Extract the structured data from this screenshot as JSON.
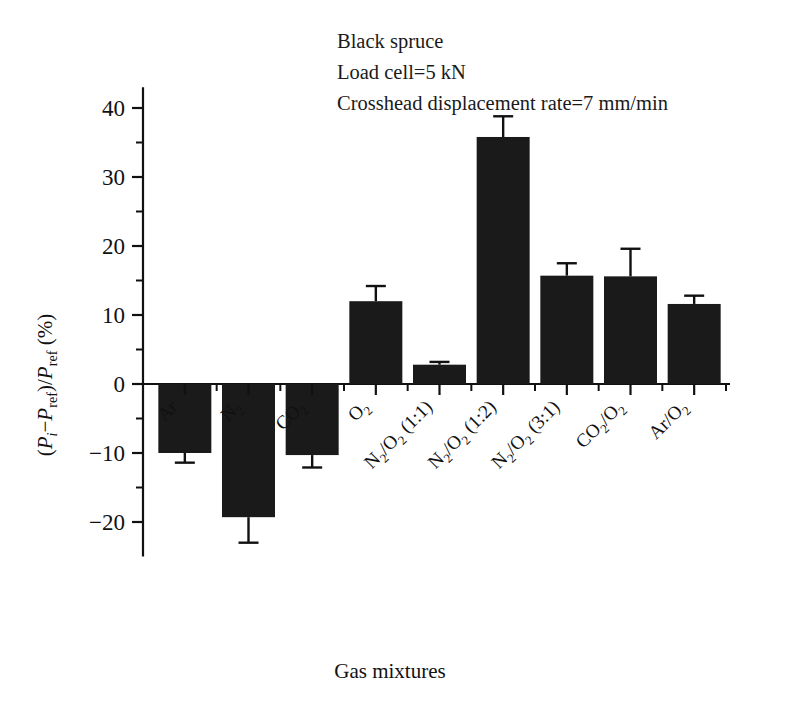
{
  "chart_data": {
    "type": "bar",
    "title": "",
    "xlabel": "Gas mixtures",
    "ylabel": "(Pi - Pref)/Pref (%)",
    "ylim": [
      -25,
      43
    ],
    "ytick_values": [
      -20,
      -10,
      0,
      10,
      20,
      30,
      40
    ],
    "ytick_labels": [
      "−20",
      "−10",
      "0",
      "10",
      "20",
      "30",
      "40"
    ],
    "yminor_values": [
      -15,
      -5,
      5,
      15,
      25,
      35
    ],
    "grid": false,
    "legend": "none",
    "bar_color": "#1a1a1a",
    "categories": [
      "Ar",
      "N2",
      "CO2",
      "O2",
      "N2/O2 (1:1)",
      "N2/O2 (1:2)",
      "N2/O2 (3:1)",
      "CO2/O2",
      "Ar/O2"
    ],
    "values": [
      -10.0,
      -19.3,
      -10.3,
      12.0,
      2.8,
      35.8,
      15.7,
      15.6,
      11.6
    ],
    "errors": [
      1.4,
      3.7,
      1.8,
      2.2,
      0.4,
      3.0,
      1.8,
      4.0,
      1.2
    ],
    "series": [
      {
        "name": "Black spruce",
        "values": [
          -10.0,
          -19.3,
          -10.3,
          12.0,
          2.8,
          35.8,
          15.7,
          15.6,
          11.6
        ],
        "errors": [
          1.4,
          3.7,
          1.8,
          2.2,
          0.4,
          3.0,
          1.8,
          4.0,
          1.2
        ]
      }
    ],
    "annotations": [
      "Black spruce",
      "Load cell 5 kN",
      "Crosshead displacement rate 7 mm/min"
    ]
  },
  "annotation_lines": [
    {
      "text": "Black spruce"
    },
    {
      "prefix": "Load cell",
      "eq": "=",
      "suffix": "5 kN"
    },
    {
      "prefix": "Crosshead displacement rate",
      "eq": "=",
      "suffix": "7 mm/min"
    }
  ],
  "axis": {
    "x_title": "Gas mixtures",
    "y_title_parts": {
      "open": "(",
      "p1": "P",
      "sub1": "i",
      "minus": "−",
      "p2": "P",
      "sub2": "ref",
      "close_slash": ")/",
      "p3": "P",
      "sub3": "ref",
      "units": " (%)"
    }
  },
  "category_labels": [
    {
      "base": "Ar",
      "sub": "",
      "tail": ""
    },
    {
      "base": "N",
      "sub": "2",
      "tail": ""
    },
    {
      "base": "CO",
      "sub": "2",
      "tail": ""
    },
    {
      "base": "O",
      "sub": "2",
      "tail": ""
    },
    {
      "base": "N",
      "sub": "2",
      "tail": "/O",
      "sub2": "2",
      "tail2": " (1:1)"
    },
    {
      "base": "N",
      "sub": "2",
      "tail": "/O",
      "sub2": "2",
      "tail2": " (1:2)"
    },
    {
      "base": "N",
      "sub": "2",
      "tail": "/O",
      "sub2": "2",
      "tail2": " (3:1)"
    },
    {
      "base": "CO",
      "sub": "2",
      "tail": "/O",
      "sub2": "2",
      "tail2": ""
    },
    {
      "base": "Ar",
      "sub": "",
      "tail": "/O",
      "sub2": "2",
      "tail2": ""
    }
  ]
}
